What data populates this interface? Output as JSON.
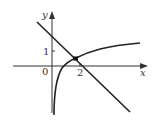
{
  "figure": {
    "type": "function-graph",
    "axes": {
      "x_label": "x",
      "y_label": "y",
      "origin_label": "0",
      "x_tick_label": "2",
      "y_tick_label": "1"
    },
    "curves": [
      {
        "name": "decreasing-line",
        "description": "straight line with negative slope, crossing y-axis above 1 and x-axis near 2"
      },
      {
        "name": "log-curve",
        "description": "increasing logarithmic-type curve, vertical asymptote at x=0, approaching horizontal level above 1"
      }
    ],
    "intersection": {
      "marked": true,
      "description": "filled dot where line meets curve, just left of x=2, slightly above x-axis"
    },
    "colors": {
      "stroke": "#222222",
      "background": "#ffffff"
    }
  }
}
